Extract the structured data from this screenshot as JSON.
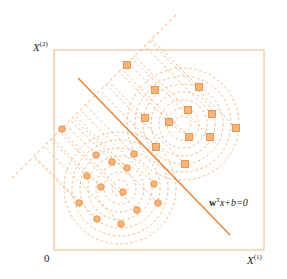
{
  "diagram": {
    "title": "",
    "axes": {
      "x_label": "X",
      "x_sup": "(1)",
      "y_label": "X",
      "y_sup": "(2)",
      "origin_label": "0"
    },
    "boundary_label": {
      "w": "w",
      "t": "T",
      "rest": "x+b=0"
    },
    "colors": {
      "accent": "#e8873a",
      "frame": "#f0b889",
      "dash": "#f2a868",
      "text": "#222222"
    },
    "frame": {
      "x": 54,
      "y": 50,
      "w": 210,
      "h": 200
    },
    "decision_line": {
      "x1": 78,
      "y1": 78,
      "x2": 230,
      "y2": 235
    },
    "projection_axis": {
      "x1": 12,
      "y1": 178,
      "x2": 176,
      "y2": 15
    },
    "class_square": {
      "marker": "square",
      "center": [
        183,
        124
      ],
      "rings": [
        8,
        16,
        24,
        32,
        40,
        48,
        56
      ],
      "points": [
        [
          127,
          65
        ],
        [
          155,
          90
        ],
        [
          199,
          87
        ],
        [
          145,
          118
        ],
        [
          169,
          122
        ],
        [
          188,
          110
        ],
        [
          212,
          114
        ],
        [
          236,
          128
        ],
        [
          189,
          137
        ],
        [
          210,
          137
        ],
        [
          156,
          147
        ],
        [
          185,
          164
        ]
      ]
    },
    "class_circle": {
      "marker": "circle",
      "center": [
        120,
        188
      ],
      "rings": [
        8,
        16,
        24,
        32,
        40,
        48,
        56
      ],
      "points": [
        [
          62,
          129
        ],
        [
          96,
          155
        ],
        [
          134,
          154
        ],
        [
          112,
          162
        ],
        [
          127,
          168
        ],
        [
          87,
          176
        ],
        [
          101,
          187
        ],
        [
          154,
          184
        ],
        [
          123,
          192
        ],
        [
          79,
          203
        ],
        [
          158,
          203
        ],
        [
          137,
          210
        ],
        [
          97,
          219
        ],
        [
          121,
          224
        ]
      ]
    }
  }
}
